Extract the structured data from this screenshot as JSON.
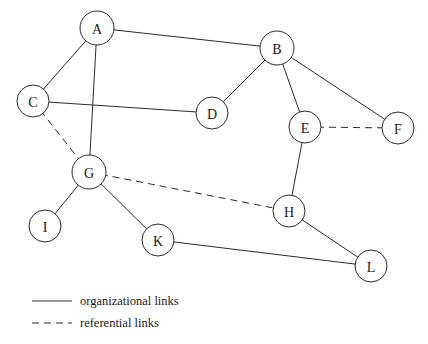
{
  "diagram": {
    "background_color": "#ffffff",
    "stroke_color": "#2b2b2b",
    "node_radius": 17,
    "nodes": [
      {
        "id": "A",
        "label": "A",
        "cx": 97,
        "cy": 28,
        "r": 17
      },
      {
        "id": "B",
        "label": "B",
        "cx": 277,
        "cy": 48,
        "r": 17
      },
      {
        "id": "C",
        "label": "C",
        "cx": 33,
        "cy": 101,
        "r": 16
      },
      {
        "id": "D",
        "label": "D",
        "cx": 212,
        "cy": 113,
        "r": 16
      },
      {
        "id": "E",
        "label": "E",
        "cx": 305,
        "cy": 127,
        "r": 16
      },
      {
        "id": "F",
        "label": "F",
        "cx": 398,
        "cy": 128,
        "r": 16
      },
      {
        "id": "G",
        "label": "G",
        "cx": 89,
        "cy": 172,
        "r": 17
      },
      {
        "id": "I",
        "label": "I",
        "cx": 45,
        "cy": 226,
        "r": 16
      },
      {
        "id": "K",
        "label": "K",
        "cx": 158,
        "cy": 240,
        "r": 16
      },
      {
        "id": "H",
        "label": "H",
        "cx": 289,
        "cy": 211,
        "r": 16
      },
      {
        "id": "L",
        "label": "L",
        "cx": 371,
        "cy": 266,
        "r": 16
      }
    ],
    "edges": [
      {
        "from": "A",
        "to": "B",
        "type": "organizational"
      },
      {
        "from": "A",
        "to": "C",
        "type": "organizational"
      },
      {
        "from": "A",
        "to": "G",
        "type": "organizational"
      },
      {
        "from": "C",
        "to": "D",
        "type": "organizational"
      },
      {
        "from": "C",
        "to": "G",
        "type": "referential"
      },
      {
        "from": "B",
        "to": "D",
        "type": "organizational"
      },
      {
        "from": "B",
        "to": "E",
        "type": "organizational"
      },
      {
        "from": "B",
        "to": "F",
        "type": "organizational"
      },
      {
        "from": "E",
        "to": "F",
        "type": "referential"
      },
      {
        "from": "E",
        "to": "H",
        "type": "organizational"
      },
      {
        "from": "G",
        "to": "H",
        "type": "referential"
      },
      {
        "from": "G",
        "to": "I",
        "type": "organizational"
      },
      {
        "from": "G",
        "to": "K",
        "type": "organizational"
      },
      {
        "from": "H",
        "to": "L",
        "type": "organizational"
      },
      {
        "from": "K",
        "to": "L",
        "type": "organizational"
      }
    ]
  },
  "legend": {
    "entries": [
      {
        "key": "organizational",
        "label": "organizational links",
        "style": "solid",
        "line_x1": 32,
        "line_x2": 72,
        "line_y": 301,
        "text_x": 80
      },
      {
        "key": "referential",
        "label": "referential links",
        "style": "dashed",
        "line_x1": 32,
        "line_x2": 72,
        "line_y": 323,
        "text_x": 80
      }
    ]
  }
}
